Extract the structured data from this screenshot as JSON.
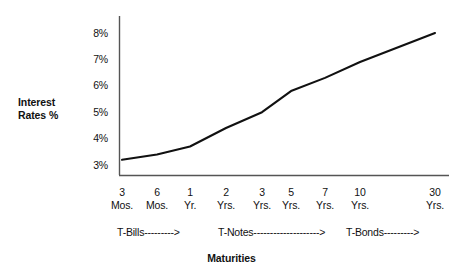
{
  "chart_data": {
    "type": "line",
    "title": "",
    "xlabel": "Maturities",
    "ylabel": "Interest Rates %",
    "categories": [
      "3 Mos.",
      "6 Mos.",
      "1 Yr.",
      "2 Yrs.",
      "3 Yrs.",
      "5 Yrs.",
      "7 Yrs.",
      "10 Yrs.",
      "30 Yrs."
    ],
    "x_tick_numbers": [
      "3",
      "6",
      "1",
      "2",
      "3",
      "5",
      "7",
      "10",
      "30"
    ],
    "x_tick_units": [
      "Mos.",
      "Mos.",
      "Yr.",
      "Yrs.",
      "Yrs.",
      "Yrs.",
      "Yrs.",
      "Yrs.",
      "Yrs."
    ],
    "values": [
      3.2,
      3.4,
      3.7,
      4.4,
      5.0,
      5.8,
      6.3,
      6.9,
      8.0
    ],
    "y_tick_labels": [
      "8%",
      "7%",
      "6%",
      "5%",
      "4%",
      "3%"
    ],
    "y_tick_values": [
      8,
      7,
      6,
      5,
      4,
      3
    ],
    "ylim": [
      3,
      8
    ],
    "grid": false,
    "legend": false,
    "line_color": "#111111",
    "axis_color": "#555555",
    "background": "#ffffff",
    "annotations": [
      {
        "label": "T-Bills--------->",
        "covers": "3 Mos. to 1 Yr."
      },
      {
        "label": "T-Notes-------------------->",
        "covers": "2 Yrs. to 10 Yrs."
      },
      {
        "label": "T-Bonds--------->",
        "covers": "30 Yrs."
      }
    ]
  },
  "y_axis": {
    "title_line1": "Interest",
    "title_line2": "Rates %"
  },
  "x_axis": {
    "title": "Maturities"
  },
  "bands": {
    "tbills": "T-Bills--------->",
    "tnotes": "T-Notes-------------------->",
    "tbonds": "T-Bonds--------->"
  }
}
